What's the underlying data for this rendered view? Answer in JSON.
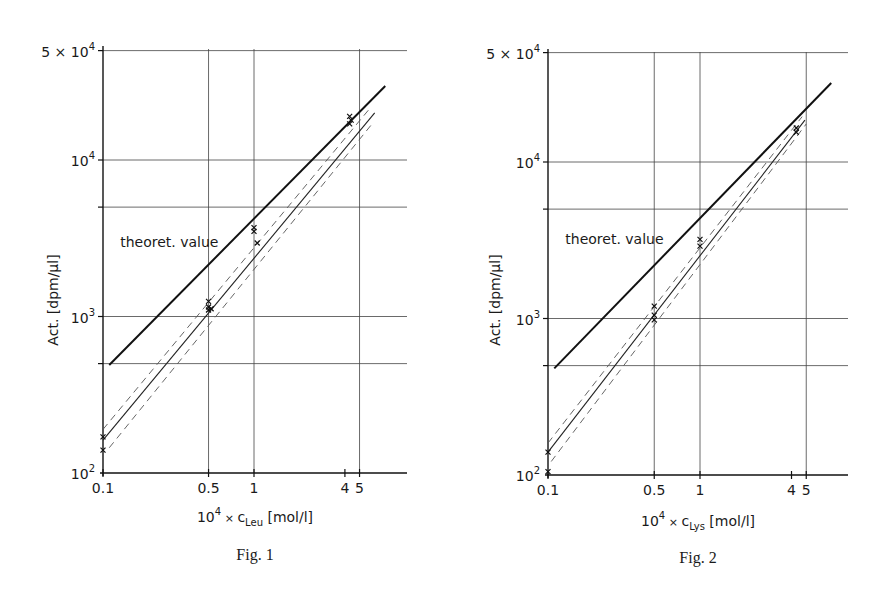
{
  "chart_data": [
    {
      "type": "line",
      "title": "",
      "caption": "Fig. 1",
      "xlabel": "10^4 × c_Leu [mol/l]",
      "xlabel_parts": {
        "prefix": "10",
        "exp": "4",
        "times": "×",
        "var": "c",
        "sub": "Leu",
        "unit": "[mol/l]"
      },
      "ylabel": "Act. [dpm/µl]",
      "xscale": "log",
      "yscale": "log",
      "xlim": [
        0.1,
        8
      ],
      "ylim": [
        100,
        50000
      ],
      "grid": true,
      "x_ticks": [
        "0.1",
        "0.5",
        "1",
        "4",
        "5"
      ],
      "x_tick_values": [
        0.1,
        0.5,
        1,
        4,
        5
      ],
      "y_ticks": [
        {
          "value": 100,
          "mant": "10",
          "exp": "2"
        },
        {
          "value": 1000,
          "mant": "10",
          "exp": "3"
        },
        {
          "value": 10000,
          "mant": "10",
          "exp": "4"
        },
        {
          "value": 50000,
          "mant": "5 × 10",
          "exp": "4"
        }
      ],
      "y_grid_values": [
        500,
        1000,
        5000,
        10000,
        50000
      ],
      "x_grid_values": [
        0.5,
        1,
        5
      ],
      "annotations": [
        {
          "text": "theoret. value",
          "x": 0.13,
          "y": 2800
        }
      ],
      "series": [
        {
          "name": "theoret. value",
          "style": "solid-thick",
          "x": [
            0.11,
            7.4
          ],
          "y": [
            490,
            29700
          ]
        },
        {
          "name": "fit",
          "style": "solid-thin",
          "x": [
            0.1,
            6.3
          ],
          "y": [
            162,
            20000
          ]
        },
        {
          "name": "upper confidence",
          "style": "dashed",
          "x": [
            0.1,
            6.0
          ],
          "y": [
            190,
            22000
          ]
        },
        {
          "name": "lower confidence",
          "style": "dashed",
          "x": [
            0.11,
            6.2
          ],
          "y": [
            145,
            17500
          ]
        },
        {
          "name": "measured",
          "style": "markers",
          "x": [
            0.1,
            0.1,
            0.5,
            0.5,
            0.5,
            0.52,
            1.0,
            1.0,
            1.05,
            4.3,
            4.3,
            4.4
          ],
          "y": [
            170,
            140,
            1250,
            1150,
            1100,
            1120,
            3700,
            3500,
            2950,
            19000,
            17000,
            18000
          ]
        }
      ]
    },
    {
      "type": "line",
      "title": "",
      "caption": "Fig. 2",
      "xlabel": "10^4 × c_Lys [mol/l]",
      "xlabel_parts": {
        "prefix": "10",
        "exp": "4",
        "times": "×",
        "var": "c",
        "sub": "Lys",
        "unit": "[mol/l]"
      },
      "ylabel": "Act. [dpm/µl]",
      "xscale": "log",
      "yscale": "log",
      "xlim": [
        0.1,
        8
      ],
      "ylim": [
        100,
        50000
      ],
      "grid": true,
      "x_ticks": [
        "0.1",
        "0.5",
        "1",
        "4",
        "5"
      ],
      "x_tick_values": [
        0.1,
        0.5,
        1,
        4,
        5
      ],
      "y_ticks": [
        {
          "value": 100,
          "mant": "10",
          "exp": "2"
        },
        {
          "value": 1000,
          "mant": "10",
          "exp": "3"
        },
        {
          "value": 10000,
          "mant": "10",
          "exp": "4"
        },
        {
          "value": 50000,
          "mant": "5 × 10",
          "exp": "4"
        }
      ],
      "y_grid_values": [
        500,
        1000,
        5000,
        10000,
        50000
      ],
      "x_grid_values": [
        0.5,
        1,
        5
      ],
      "annotations": [
        {
          "text": "theoret. value",
          "x": 0.13,
          "y": 3000
        }
      ],
      "series": [
        {
          "name": "theoret. value",
          "style": "solid-thick",
          "x": [
            0.11,
            7.3
          ],
          "y": [
            480,
            32000
          ]
        },
        {
          "name": "fit",
          "style": "solid-thin",
          "x": [
            0.1,
            4.9
          ],
          "y": [
            140,
            18500
          ]
        },
        {
          "name": "upper confidence",
          "style": "dashed",
          "x": [
            0.1,
            4.7
          ],
          "y": [
            160,
            19500
          ]
        },
        {
          "name": "lower confidence",
          "style": "dashed",
          "x": [
            0.105,
            5.0
          ],
          "y": [
            122,
            17500
          ]
        },
        {
          "name": "measured",
          "style": "markers",
          "x": [
            0.1,
            0.1,
            0.5,
            0.5,
            0.5,
            1.0,
            1.0,
            4.3,
            4.3
          ],
          "y": [
            140,
            105,
            1200,
            1050,
            980,
            3200,
            2900,
            16500,
            15500
          ]
        }
      ]
    }
  ]
}
